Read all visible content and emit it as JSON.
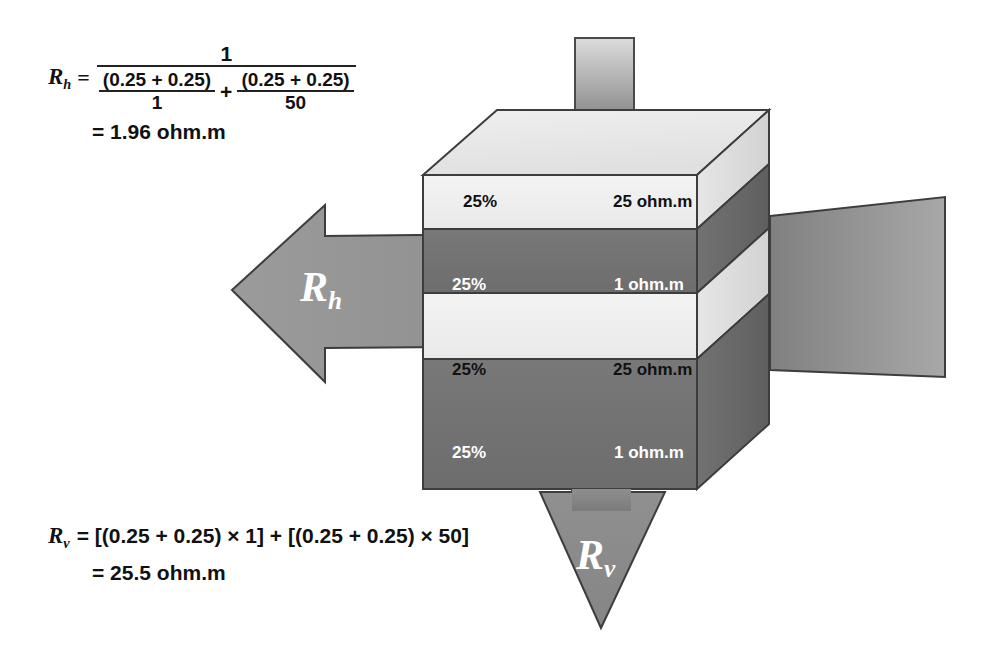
{
  "figure": {
    "unit": "ohm.m"
  },
  "colors": {
    "light_layer": "#efefef",
    "dark_layer": "#737373",
    "arrow": "#8d8d8d",
    "side_light": "#e2e2e2",
    "side_dark": "#6a6a6a",
    "top_face": "#e8e8e8",
    "outline": "#3a3a3a",
    "stem_light": "#d8d8d8",
    "stem_dark": "#6f6f6f",
    "text_dark": "#111111",
    "text_light": "#ffffff"
  },
  "rh_formula": {
    "lhs_var": "R",
    "lhs_sub": "h",
    "equals": "=",
    "numerator": "1",
    "term1_numerator": "(0.25 + 0.25)",
    "term1_denominator": "1",
    "plus": "+",
    "term2_numerator": "(0.25 + 0.25)",
    "term2_denominator": "50",
    "result": "= 1.96 ohm.m"
  },
  "rv_formula": {
    "lhs_var": "R",
    "lhs_sub": "v",
    "expression": "= [(0.25 + 0.25) × 1] + [(0.25 + 0.25) × 50]",
    "result": "= 25.5 ohm.m"
  },
  "layers": [
    {
      "index": 1,
      "fraction": "25%",
      "resistivity": "25 ohm.m",
      "shade": "light"
    },
    {
      "index": 2,
      "fraction": "25%",
      "resistivity": "1 ohm.m",
      "shade": "dark"
    },
    {
      "index": 3,
      "fraction": "25%",
      "resistivity": "25 ohm.m",
      "shade": "light"
    },
    {
      "index": 4,
      "fraction": "25%",
      "resistivity": "1 ohm.m",
      "shade": "dark"
    }
  ],
  "arrows": {
    "horizontal": {
      "var": "R",
      "sub": "h",
      "direction": "left"
    },
    "vertical": {
      "var": "R",
      "sub": "v",
      "direction": "down"
    }
  }
}
